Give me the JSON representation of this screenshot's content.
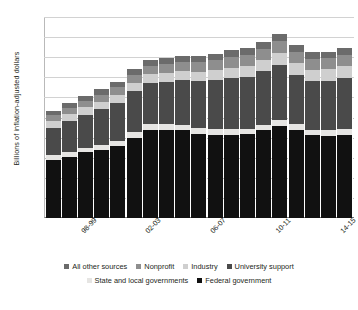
{
  "chart_data": {
    "type": "bar",
    "stacked": true,
    "title": "",
    "xlabel": "",
    "ylabel": "Billions of inflation-adjusted dollars",
    "ylim": [
      0.0,
      5.0
    ],
    "ytick_labels": [
      "$5.0",
      "$4.5",
      "$4.0",
      "$3.5",
      "$3.0",
      "$2.5",
      "$2.0",
      "$1.5",
      "$1.0",
      "$0.5",
      "$0.0"
    ],
    "ytick_values": [
      5.0,
      4.5,
      4.0,
      3.5,
      3.0,
      2.5,
      2.0,
      1.5,
      1.0,
      0.5,
      0.0
    ],
    "grid": true,
    "legend_position": "bottom",
    "categories": [
      "96-97",
      "97-98",
      "98-99",
      "99-00",
      "00-01",
      "01-02",
      "02-03",
      "03-04",
      "04-05",
      "05-06",
      "06-07",
      "07-08",
      "08-09",
      "09-10",
      "10-11",
      "11-12",
      "12-13",
      "13-14",
      "14-15"
    ],
    "visible_xtick_labels": [
      "98-99",
      "02-03",
      "06-07",
      "10-11",
      "14-15"
    ],
    "visible_xtick_indices": [
      2,
      6,
      10,
      14,
      18
    ],
    "series": [
      {
        "name": "Federal government",
        "color": "#111111",
        "values": [
          1.45,
          1.53,
          1.63,
          1.68,
          1.78,
          2.0,
          2.19,
          2.19,
          2.18,
          2.1,
          2.07,
          2.07,
          2.08,
          2.18,
          2.3,
          2.2,
          2.06,
          2.05,
          2.07
        ]
      },
      {
        "name": "State and local governments",
        "color": "#e6e5e3",
        "values": [
          0.11,
          0.12,
          0.12,
          0.13,
          0.13,
          0.14,
          0.14,
          0.14,
          0.14,
          0.14,
          0.14,
          0.14,
          0.14,
          0.14,
          0.15,
          0.15,
          0.14,
          0.14,
          0.14
        ]
      },
      {
        "name": "University support",
        "color": "#4a4a4a",
        "values": [
          0.69,
          0.76,
          0.82,
          0.89,
          0.96,
          1.01,
          1.03,
          1.06,
          1.11,
          1.16,
          1.22,
          1.27,
          1.3,
          1.33,
          1.36,
          1.22,
          1.2,
          1.23,
          1.27
        ]
      },
      {
        "name": "Industry",
        "color": "#cfcfcf",
        "values": [
          0.16,
          0.17,
          0.18,
          0.19,
          0.2,
          0.21,
          0.22,
          0.22,
          0.23,
          0.24,
          0.25,
          0.26,
          0.27,
          0.28,
          0.3,
          0.29,
          0.28,
          0.28,
          0.29
        ]
      },
      {
        "name": "Nonprofit",
        "color": "#8e8e8e",
        "values": [
          0.15,
          0.16,
          0.17,
          0.18,
          0.19,
          0.2,
          0.21,
          0.22,
          0.23,
          0.24,
          0.25,
          0.26,
          0.27,
          0.28,
          0.29,
          0.28,
          0.27,
          0.27,
          0.28
        ]
      },
      {
        "name": "All other sources",
        "color": "#6b6b6b",
        "values": [
          0.11,
          0.12,
          0.12,
          0.13,
          0.13,
          0.14,
          0.14,
          0.15,
          0.15,
          0.16,
          0.16,
          0.17,
          0.17,
          0.18,
          0.18,
          0.17,
          0.17,
          0.17,
          0.18
        ]
      }
    ],
    "totals": [
      2.67,
      2.86,
      3.04,
      3.2,
      3.39,
      3.7,
      3.93,
      3.98,
      4.04,
      4.04,
      4.09,
      4.17,
      4.23,
      4.39,
      4.58,
      4.31,
      4.12,
      4.14,
      4.23
    ]
  },
  "legend": {
    "rows": [
      [
        {
          "label": "All other sources",
          "color": "#6b6b6b"
        },
        {
          "label": "Nonprofit",
          "color": "#8e8e8e"
        },
        {
          "label": "Industry",
          "color": "#cfcfcf"
        },
        {
          "label": "University support",
          "color": "#4a4a4a"
        }
      ],
      [
        {
          "label": "State and local governments",
          "color": "#e6e5e3"
        },
        {
          "label": "Federal government",
          "color": "#111111"
        }
      ]
    ]
  }
}
